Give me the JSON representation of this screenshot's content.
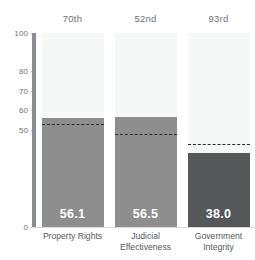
{
  "chart_data": {
    "type": "bar",
    "title": "",
    "xlabel": "",
    "ylabel": "",
    "ylim": [
      0,
      100
    ],
    "grid": false,
    "legend_position": "none",
    "categories": [
      "Property Rights",
      "Judicial Effectiveness",
      "Government Integrity"
    ],
    "values": [
      56.1,
      56.5,
      38.0
    ],
    "value_labels": [
      "56.1",
      "56.5",
      "38.0"
    ],
    "percentile_labels": [
      "70th",
      "52nd",
      "93rd"
    ],
    "reference_lines": [
      53.0,
      48.0,
      43.0
    ],
    "yticks": [
      0,
      50,
      60,
      70,
      80,
      100
    ],
    "ytick_labels": [
      "0",
      "50",
      "60",
      "70",
      "80",
      "100"
    ],
    "series": [
      {
        "name": "Score",
        "values": [
          56.1,
          56.5,
          38.0
        ],
        "colors": [
          "#8e8e8e",
          "#8e8e8e",
          "#555759"
        ]
      },
      {
        "name": "Reference average",
        "values": [
          53.0,
          48.0,
          43.0
        ],
        "style": "dashed"
      }
    ],
    "colors": {
      "bar_light": "#8e8e8e",
      "bar_dark": "#555759",
      "column_background": "#f6f7f7",
      "axis": "#8a8d8f",
      "tick_text": "#6f7376",
      "category_text": "#53585b",
      "value_text": "#ffffff",
      "dashed_line": "#2b2b2b"
    }
  }
}
